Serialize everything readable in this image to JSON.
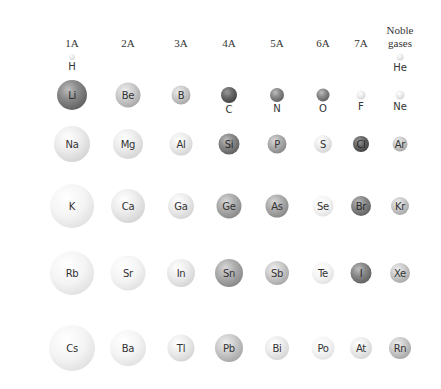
{
  "group_headers": [
    {
      "id": "1A",
      "label": "1A",
      "x": 72
    },
    {
      "id": "2A",
      "label": "2A",
      "x": 128
    },
    {
      "id": "3A",
      "label": "3A",
      "x": 181
    },
    {
      "id": "4A",
      "label": "4A",
      "x": 229
    },
    {
      "id": "5A",
      "label": "5A",
      "x": 277
    },
    {
      "id": "6A",
      "label": "6A",
      "x": 323
    },
    {
      "id": "7A",
      "label": "7A",
      "x": 361
    },
    {
      "id": "noble",
      "label_line1": "Noble",
      "label_line2": "gases",
      "x": 400
    }
  ],
  "periods": [
    {
      "period": 1,
      "elements": [
        {
          "symbol": "H",
          "group": "1A",
          "size": 6,
          "shade": "light",
          "label_below": true
        },
        {
          "symbol": "He",
          "group": "noble",
          "size": 7,
          "shade": "light",
          "label_below": true
        }
      ]
    },
    {
      "period": 2,
      "elements": [
        {
          "symbol": "Li",
          "group": "1A",
          "size": 30,
          "shade": "dark",
          "label_below": false
        },
        {
          "symbol": "Be",
          "group": "2A",
          "size": 25,
          "shade": "mid",
          "label_below": false
        },
        {
          "symbol": "B",
          "group": "3A",
          "size": 19,
          "shade": "mid",
          "label_below": false
        },
        {
          "symbol": "C",
          "group": "4A",
          "size": 16,
          "shade": "vdark",
          "label_below": true
        },
        {
          "symbol": "N",
          "group": "5A",
          "size": 14,
          "shade": "dark",
          "label_below": true
        },
        {
          "symbol": "O",
          "group": "6A",
          "size": 13,
          "shade": "dark",
          "label_below": true
        },
        {
          "symbol": "F",
          "group": "7A",
          "size": 9,
          "shade": "light",
          "label_below": true
        },
        {
          "symbol": "Ne",
          "group": "noble",
          "size": 9,
          "shade": "light",
          "label_below": true
        }
      ]
    },
    {
      "period": 3,
      "elements": [
        {
          "symbol": "Na",
          "group": "1A",
          "size": 36,
          "shade": "light",
          "label_below": false
        },
        {
          "symbol": "Mg",
          "group": "2A",
          "size": 30,
          "shade": "light",
          "label_below": false
        },
        {
          "symbol": "Al",
          "group": "3A",
          "size": 23,
          "shade": "light",
          "label_below": false
        },
        {
          "symbol": "Si",
          "group": "4A",
          "size": 21,
          "shade": "dark",
          "label_below": false
        },
        {
          "symbol": "P",
          "group": "5A",
          "size": 19,
          "shade": "midd",
          "label_below": false
        },
        {
          "symbol": "S",
          "group": "6A",
          "size": 18,
          "shade": "light",
          "label_below": false
        },
        {
          "symbol": "Cl",
          "group": "7A",
          "size": 16,
          "shade": "vdark",
          "label_below": false
        },
        {
          "symbol": "Ar",
          "group": "noble",
          "size": 15,
          "shade": "mid",
          "label_below": false
        }
      ]
    },
    {
      "period": 4,
      "elements": [
        {
          "symbol": "K",
          "group": "1A",
          "size": 44,
          "shade": "white",
          "label_below": false
        },
        {
          "symbol": "Ca",
          "group": "2A",
          "size": 34,
          "shade": "light",
          "label_below": false
        },
        {
          "symbol": "Ga",
          "group": "3A",
          "size": 26,
          "shade": "light",
          "label_below": false
        },
        {
          "symbol": "Ge",
          "group": "4A",
          "size": 25,
          "shade": "midd",
          "label_below": false
        },
        {
          "symbol": "As",
          "group": "5A",
          "size": 23,
          "shade": "midd",
          "label_below": false
        },
        {
          "symbol": "Se",
          "group": "6A",
          "size": 21,
          "shade": "white",
          "label_below": false
        },
        {
          "symbol": "Br",
          "group": "7A",
          "size": 20,
          "shade": "dark",
          "label_below": false
        },
        {
          "symbol": "Kr",
          "group": "noble",
          "size": 18,
          "shade": "mid",
          "label_below": false
        }
      ]
    },
    {
      "period": 5,
      "elements": [
        {
          "symbol": "Rb",
          "group": "1A",
          "size": 44,
          "shade": "white",
          "label_below": false
        },
        {
          "symbol": "Sr",
          "group": "2A",
          "size": 35,
          "shade": "white",
          "label_below": false
        },
        {
          "symbol": "In",
          "group": "3A",
          "size": 28,
          "shade": "light",
          "label_below": false
        },
        {
          "symbol": "Sn",
          "group": "4A",
          "size": 28,
          "shade": "midd",
          "label_below": false
        },
        {
          "symbol": "Sb",
          "group": "5A",
          "size": 24,
          "shade": "mid",
          "label_below": false
        },
        {
          "symbol": "Te",
          "group": "6A",
          "size": 22,
          "shade": "white",
          "label_below": false
        },
        {
          "symbol": "I",
          "group": "7A",
          "size": 21,
          "shade": "dark",
          "label_below": false
        },
        {
          "symbol": "Xe",
          "group": "noble",
          "size": 20,
          "shade": "mid",
          "label_below": false
        }
      ]
    },
    {
      "period": 6,
      "elements": [
        {
          "symbol": "Cs",
          "group": "1A",
          "size": 46,
          "shade": "white",
          "label_below": false
        },
        {
          "symbol": "Ba",
          "group": "2A",
          "size": 36,
          "shade": "white",
          "label_below": false
        },
        {
          "symbol": "Tl",
          "group": "3A",
          "size": 27,
          "shade": "light",
          "label_below": false
        },
        {
          "symbol": "Pb",
          "group": "4A",
          "size": 28,
          "shade": "mid",
          "label_below": false
        },
        {
          "symbol": "Bi",
          "group": "5A",
          "size": 24,
          "shade": "light",
          "label_below": false
        },
        {
          "symbol": "Po",
          "group": "6A",
          "size": 23,
          "shade": "white",
          "label_below": false
        },
        {
          "symbol": "At",
          "group": "7A",
          "size": 22,
          "shade": "light",
          "label_below": false
        },
        {
          "symbol": "Rn",
          "group": "noble",
          "size": 22,
          "shade": "mid",
          "label_below": false
        }
      ]
    }
  ],
  "row_y": {
    "1": 57,
    "2": 95,
    "3": 144,
    "4": 206,
    "5": 273,
    "6": 348
  },
  "header_y": 43
}
